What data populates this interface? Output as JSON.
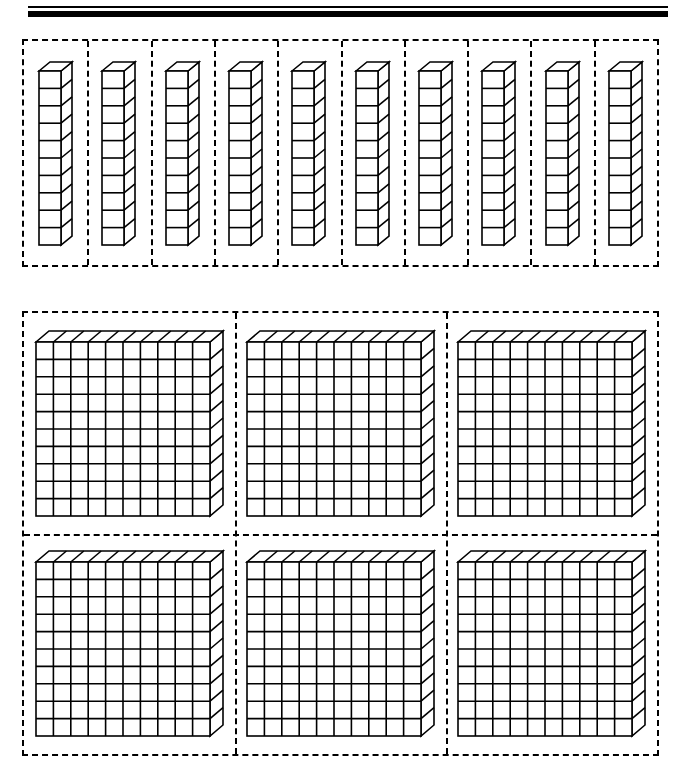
{
  "page": {
    "background_color": "#ffffff",
    "ink_color": "#000000",
    "width": 680,
    "height": 764
  },
  "header_rules": {
    "name": "double-rule-divider",
    "thin_rule": {
      "thickness_px": 1.5,
      "color": "#000000"
    },
    "thick_rule": {
      "thickness_px": 6,
      "color": "#000000"
    }
  },
  "rods_section": {
    "name": "tens-rods-row",
    "cell_count": 10,
    "block_type": "rod",
    "units_per_block": 10,
    "total_value": 100,
    "cubes_per_rod": 10,
    "border_style": "dashed",
    "border_color": "#000000",
    "items": [
      {
        "index": 1,
        "label": "rod",
        "value": 10
      },
      {
        "index": 2,
        "label": "rod",
        "value": 10
      },
      {
        "index": 3,
        "label": "rod",
        "value": 10
      },
      {
        "index": 4,
        "label": "rod",
        "value": 10
      },
      {
        "index": 5,
        "label": "rod",
        "value": 10
      },
      {
        "index": 6,
        "label": "rod",
        "value": 10
      },
      {
        "index": 7,
        "label": "rod",
        "value": 10
      },
      {
        "index": 8,
        "label": "rod",
        "value": 10
      },
      {
        "index": 9,
        "label": "rod",
        "value": 10
      },
      {
        "index": 10,
        "label": "rod",
        "value": 10
      }
    ]
  },
  "flats_section": {
    "name": "hundreds-flats-grid",
    "rows": 2,
    "columns": 3,
    "cell_count": 6,
    "block_type": "flat",
    "units_per_block": 100,
    "grid_rows_per_flat": 10,
    "grid_cols_per_flat": 10,
    "total_value": 600,
    "border_style": "dashed",
    "border_color": "#000000",
    "items": [
      {
        "index": 1,
        "row": 1,
        "column": 1,
        "label": "flat",
        "value": 100
      },
      {
        "index": 2,
        "row": 1,
        "column": 2,
        "label": "flat",
        "value": 100
      },
      {
        "index": 3,
        "row": 1,
        "column": 3,
        "label": "flat",
        "value": 100
      },
      {
        "index": 4,
        "row": 2,
        "column": 1,
        "label": "flat",
        "value": 100
      },
      {
        "index": 5,
        "row": 2,
        "column": 2,
        "label": "flat",
        "value": 100
      },
      {
        "index": 6,
        "row": 2,
        "column": 3,
        "label": "flat",
        "value": 100
      }
    ]
  },
  "chart_data": {
    "type": "bar",
    "xlabel": "",
    "ylabel": "",
    "categories": [
      "Tens rods",
      "Hundreds flats"
    ],
    "values": [
      10,
      6
    ],
    "annotations": [
      "10 rods × 10 units = 100",
      "6 flats × 100 units = 600"
    ]
  }
}
